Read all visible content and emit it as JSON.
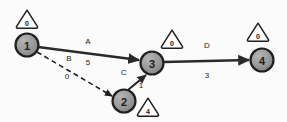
{
  "diagram": {
    "colors": {
      "background": "#fbfbfb",
      "node_fill": "#9a9a9a",
      "node_stroke": "#1f1f1f",
      "edge_stroke": "#2a2a2a",
      "badge_stroke": "#1f1f1f",
      "badge_fill": "#ffffff",
      "text": "#1a1a1a"
    },
    "nodes": [
      {
        "id": "1",
        "label": "1",
        "cx": 27,
        "cy": 45,
        "r": 11.5
      },
      {
        "id": "2",
        "label": "2",
        "cx": 124,
        "cy": 101,
        "r": 11.5
      },
      {
        "id": "3",
        "label": "3",
        "cx": 152,
        "cy": 63,
        "r": 11.5
      },
      {
        "id": "4",
        "label": "4",
        "cx": 262,
        "cy": 60,
        "r": 11.5
      }
    ],
    "badges": [
      {
        "for": "1",
        "value": "0",
        "cx": 27,
        "cy": 19
      },
      {
        "for": "3",
        "value": "0",
        "cx": 172,
        "cy": 39
      },
      {
        "for": "4",
        "value": "0",
        "cx": 258,
        "cy": 32
      },
      {
        "for": "2",
        "value": "4",
        "cx": 148,
        "cy": 107
      }
    ],
    "edges": [
      {
        "id": "A",
        "from": "1",
        "to": "3",
        "name": "A",
        "weight": "5",
        "style": "solid",
        "x1": 38,
        "y1": 47,
        "x2": 139,
        "y2": 60,
        "name_x": 88,
        "name_y": 41,
        "weight_x": 88,
        "weight_y": 62
      },
      {
        "id": "B",
        "from": "1",
        "to": "2",
        "name": "B",
        "weight": "0",
        "style": "dashed",
        "x1": 37,
        "y1": 52,
        "x2": 112,
        "y2": 96,
        "name_x": 69,
        "name_y": 58,
        "weight_x": 67,
        "weight_y": 76
      },
      {
        "id": "C",
        "from": "2",
        "to": "3",
        "name": "C",
        "weight": "1",
        "style": "solid",
        "x1": 128,
        "y1": 90,
        "x2": 146,
        "y2": 75,
        "name_x": 124,
        "name_y": 72,
        "weight_x": 141,
        "weight_y": 85
      },
      {
        "id": "D",
        "from": "3",
        "to": "4",
        "name": "D",
        "weight": "3",
        "style": "solid",
        "x1": 164,
        "y1": 62,
        "x2": 249,
        "y2": 60,
        "name_x": 207,
        "name_y": 45,
        "weight_x": 207,
        "weight_y": 75
      }
    ]
  }
}
